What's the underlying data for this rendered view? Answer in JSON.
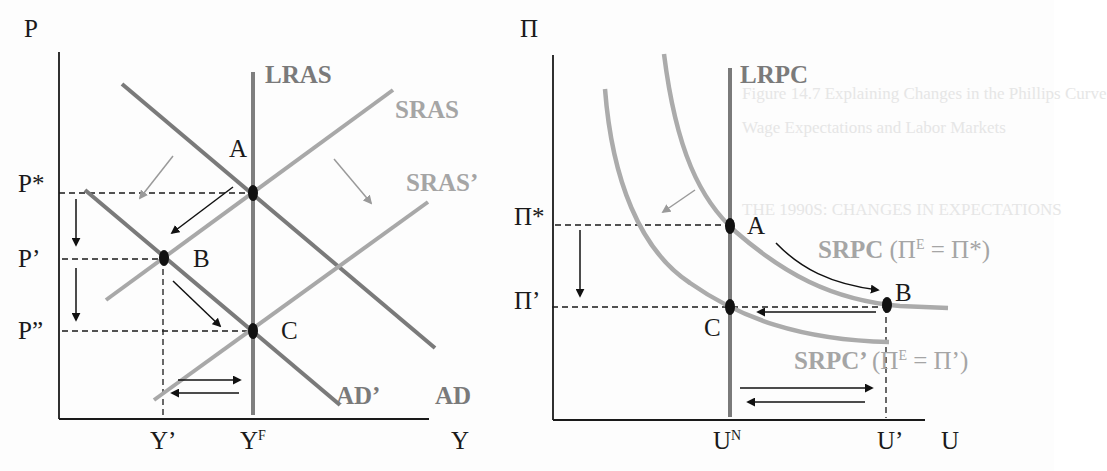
{
  "figure": {
    "left_panel": {
      "title": "AD-AS model",
      "y_axis_label": "P",
      "x_axis_label": "Y",
      "curves": {
        "lras": "LRAS",
        "sras": "SRAS",
        "sras_prime": "SRAS’",
        "ad": "AD",
        "ad_prime": "AD’"
      },
      "points": {
        "a": "A",
        "b": "B",
        "c": "C"
      },
      "price_ticks": {
        "p_star": "P*",
        "p_prime": "P’",
        "p_double_prime": "P”"
      },
      "output_ticks": {
        "y_prime": "Y’",
        "y_f_base": "Y",
        "y_f_sup": "F"
      }
    },
    "right_panel": {
      "title": "Phillips curve",
      "y_axis_label": "Π",
      "x_axis_label": "U",
      "curves": {
        "lrpc": "LRPC",
        "srpc_name": "SRPC",
        "srpc_paren_open": "(Π",
        "srpc_sup": "E",
        "srpc_paren_close": " = Π*)",
        "srpc_prime_name": "SRPC’",
        "srpc_prime_paren_open": "(Π",
        "srpc_prime_sup": "E",
        "srpc_prime_paren_close": " = Π’)"
      },
      "points": {
        "a": "A",
        "b": "B",
        "c": "C"
      },
      "inflation_ticks": {
        "pi_star": "Π*",
        "pi_prime": "Π’"
      },
      "unemployment_ticks": {
        "u_n_base": "U",
        "u_n_sup": "N",
        "u_prime": "U’"
      }
    },
    "colors": {
      "axis": "#1a1a1a",
      "lras": "#7f7f7f",
      "ad": "#7a7a7a",
      "sras": "#a8a8a8",
      "lrpc": "#7a7a7a",
      "srpc": "#ababab",
      "arrow_black": "#111111",
      "arrow_grey": "#9a9a9a",
      "background": "#fdfdfd"
    },
    "bleed_through_text": [
      "Figure 14.7  Explaining Changes in the Phillips Curve",
      "Wage Expectations and Labor Markets",
      "THE 1990S: CHANGES IN EXPECTATIONS"
    ]
  }
}
